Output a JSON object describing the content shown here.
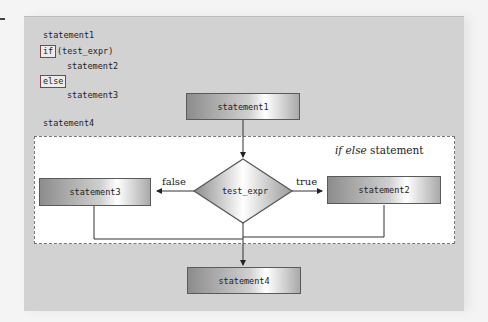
{
  "code": {
    "line1": "statement1",
    "if_keyword": "if",
    "condition": "(test_expr)",
    "line3": "statement2",
    "else_keyword": "else",
    "line5": "statement3",
    "line6": "statement4"
  },
  "diagram": {
    "title_italic": "if else",
    "title_rest": " statement",
    "box_top": "statement1",
    "decision": "test_expr",
    "false_label": "false",
    "true_label": "true",
    "box_false": "statement3",
    "box_true": "statement2",
    "box_bottom": "statement4"
  },
  "colors": {
    "panel": "#d2d2d2",
    "keyword_border": "#8a4040",
    "box_border": "#5a5a5a"
  }
}
